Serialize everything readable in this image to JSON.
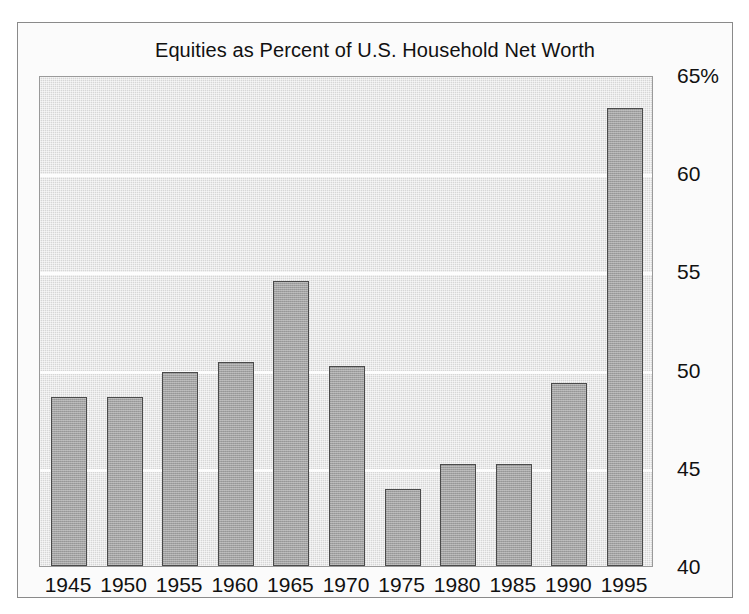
{
  "chart_data": {
    "type": "bar",
    "title": "Equities as Percent of U.S. Household Net Worth",
    "xlabel": "",
    "ylabel": "",
    "categories": [
      "1945",
      "1950",
      "1955",
      "1960",
      "1965",
      "1970",
      "1975",
      "1980",
      "1985",
      "1990",
      "1995"
    ],
    "values": [
      48.6,
      48.6,
      49.9,
      50.4,
      54.5,
      50.2,
      43.9,
      45.2,
      45.2,
      49.3,
      63.3
    ],
    "ylim": [
      40,
      65
    ],
    "ytick_labels": [
      "65%",
      "60",
      "55",
      "50",
      "45",
      "40"
    ],
    "ytick_values": [
      65,
      60,
      55,
      50,
      45,
      40
    ],
    "gridlines": [
      60,
      55,
      50,
      45
    ],
    "grid": true,
    "legend": "none",
    "y_axis_position": "right",
    "bar_color": "#a2a2a2",
    "bar_border_color": "#4a4a4a",
    "plot_background_color": "#d6d6d6",
    "gridline_color": "#fdfdfd",
    "figure_background_color": "#fbfbfb",
    "text_color": "#111111"
  }
}
